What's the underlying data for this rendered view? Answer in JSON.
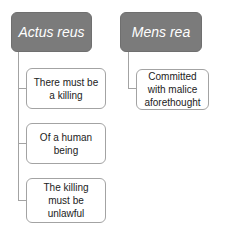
{
  "diagram": {
    "type": "hierarchy",
    "colors": {
      "header_fill": "#7b7b7b",
      "header_text": "#ffffff",
      "child_border": "#a3a3a3",
      "child_text": "#222222",
      "connector": "#a3a3a3"
    },
    "columns": [
      {
        "title": "Actus reus",
        "children": [
          {
            "label": "There must be a killing"
          },
          {
            "label": "Of a human being"
          },
          {
            "label": "The killing must be unlawful"
          }
        ]
      },
      {
        "title": "Mens rea",
        "children": [
          {
            "label": "Committed with malice aforethought"
          }
        ]
      }
    ]
  }
}
